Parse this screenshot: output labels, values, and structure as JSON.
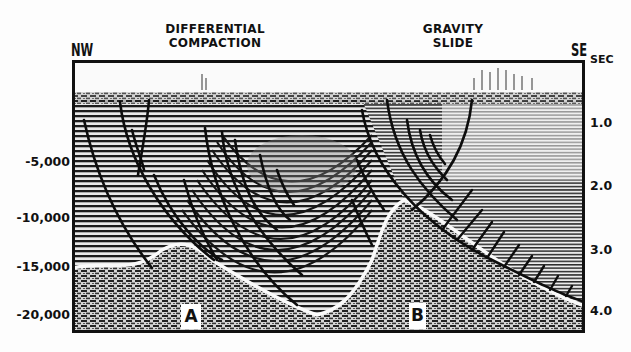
{
  "labels": {
    "nw": "NW",
    "se": "SE",
    "sec_unit": "SEC",
    "title_left": [
      "DIFFERENTIAL",
      "COMPACTION"
    ],
    "title_right": [
      "GRAVITY",
      "SLIDE"
    ]
  },
  "depth_axis": {
    "side": "left",
    "ticks": [
      "-5,000",
      "-10,000",
      "-15,000",
      "-20,000"
    ]
  },
  "time_axis": {
    "side": "right",
    "unit": "SEC",
    "ticks": [
      "1.0",
      "2.0",
      "3.0",
      "4.0"
    ]
  },
  "points": [
    {
      "label": "A"
    },
    {
      "label": "B"
    }
  ],
  "colors": {
    "ink": "#111111",
    "paper": "#fdfdfd",
    "reflector_light": "#e8e8e8",
    "reflector_dark": "#1a1a1a"
  }
}
